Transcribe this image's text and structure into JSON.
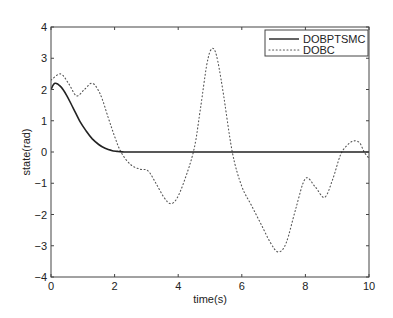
{
  "chart_data": {
    "type": "line",
    "title": "",
    "xlabel": "time(s)",
    "ylabel": "state(rad)",
    "xlim": [
      0,
      10
    ],
    "ylim": [
      -4,
      4
    ],
    "xticks": [
      0,
      2,
      4,
      6,
      8,
      10
    ],
    "yticks": [
      -4,
      -3,
      -2,
      -1,
      0,
      1,
      2,
      3,
      4
    ],
    "xtick_labels": [
      "0",
      "2",
      "4",
      "6",
      "8",
      "10"
    ],
    "ytick_labels": [
      "−4",
      "−3",
      "−2",
      "−1",
      "0",
      "1",
      "2",
      "3",
      "4"
    ],
    "grid": false,
    "legend_position": "upper right",
    "series": [
      {
        "name": "DOBPTSMC",
        "style": "solid",
        "color": "#222222",
        "x": [
          0,
          0.12,
          0.3,
          0.5,
          0.7,
          0.9,
          1.1,
          1.3,
          1.5,
          1.7,
          1.9,
          2.1,
          2.3,
          2.6,
          3.0,
          4.0,
          5.0,
          6.0,
          7.0,
          8.0,
          9.0,
          10.0
        ],
        "y": [
          2.0,
          2.2,
          2.1,
          1.8,
          1.4,
          1.0,
          0.68,
          0.42,
          0.24,
          0.12,
          0.05,
          0.02,
          0.0,
          0.0,
          0.0,
          0.0,
          0.0,
          0.0,
          0.0,
          0.0,
          0.0,
          0.0
        ]
      },
      {
        "name": "DOBC",
        "style": "dotted",
        "color": "#555555",
        "x": [
          0,
          0.3,
          0.55,
          0.8,
          1.05,
          1.3,
          1.55,
          1.8,
          2.0,
          2.2,
          2.5,
          2.8,
          3.05,
          3.3,
          3.55,
          3.75,
          3.95,
          4.2,
          4.5,
          4.7,
          4.9,
          5.05,
          5.2,
          5.4,
          5.7,
          6.0,
          6.3,
          6.6,
          6.9,
          7.15,
          7.4,
          7.7,
          8.0,
          8.3,
          8.6,
          8.85,
          9.1,
          9.3,
          9.5,
          9.7,
          9.85,
          10.0
        ],
        "y": [
          2.3,
          2.5,
          2.2,
          1.8,
          2.0,
          2.2,
          1.85,
          1.1,
          0.5,
          0.0,
          -0.4,
          -0.55,
          -0.6,
          -1.0,
          -1.45,
          -1.65,
          -1.5,
          -0.9,
          0.1,
          1.4,
          2.8,
          3.3,
          3.1,
          2.0,
          0.0,
          -1.1,
          -1.7,
          -2.3,
          -2.9,
          -3.2,
          -2.9,
          -1.8,
          -0.85,
          -1.1,
          -1.45,
          -0.9,
          -0.1,
          0.2,
          0.35,
          0.3,
          0.0,
          -0.2
        ]
      }
    ]
  },
  "figure": {
    "plot_area": {
      "left": 51,
      "top": 27,
      "right": 369,
      "bottom": 277
    },
    "axis_color": "#444444",
    "background": "#ffffff"
  }
}
